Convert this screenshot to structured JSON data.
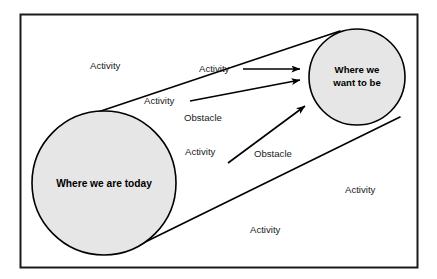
{
  "diagram": {
    "type": "gap-analysis-cone-diagram",
    "frame": {
      "border_color": "#1a1a1a",
      "background": "#ffffff"
    },
    "nodes": [
      {
        "id": "current-state",
        "label_lines": [
          "Where we are today"
        ],
        "cx": 104,
        "cy": 183,
        "r": 72,
        "fill": "#e6e6e6",
        "stroke": "#000000"
      },
      {
        "id": "future-state",
        "label_lines": [
          "Where we",
          "want to be"
        ],
        "cx": 357,
        "cy": 77,
        "r": 48,
        "fill": "#e6e6e6",
        "stroke": "#000000"
      }
    ],
    "arrows": [
      {
        "id": "arrow-1",
        "x1": 243,
        "y1": 69,
        "x2": 300,
        "y2": 69
      },
      {
        "id": "arrow-2",
        "x1": 190,
        "y1": 101,
        "x2": 300,
        "y2": 80
      },
      {
        "id": "arrow-3",
        "x1": 228,
        "y1": 163,
        "x2": 305,
        "y2": 106
      }
    ],
    "tangents": [
      {
        "id": "tangent-top",
        "x1": 68,
        "y1": 122,
        "x2": 340,
        "y2": 31
      },
      {
        "id": "tangent-bottom",
        "x1": 133,
        "y1": 248,
        "x2": 400,
        "y2": 117
      }
    ],
    "labels": [
      {
        "id": "label-activity-1",
        "text": "Activity",
        "x": 90,
        "y": 66,
        "anchor": "start"
      },
      {
        "id": "label-activity-2",
        "text": "Activity",
        "x": 199,
        "y": 69,
        "anchor": "start"
      },
      {
        "id": "label-activity-3",
        "text": "Activity",
        "x": 144,
        "y": 101,
        "anchor": "start"
      },
      {
        "id": "label-obstacle-1",
        "text": "Obstacle",
        "x": 184,
        "y": 118,
        "anchor": "start"
      },
      {
        "id": "label-activity-4",
        "text": "Activity",
        "x": 185,
        "y": 152,
        "anchor": "start"
      },
      {
        "id": "label-obstacle-2",
        "text": "Obstacle",
        "x": 254,
        "y": 154,
        "anchor": "start"
      },
      {
        "id": "label-activity-5",
        "text": "Activity",
        "x": 345,
        "y": 190,
        "anchor": "start"
      },
      {
        "id": "label-activity-6",
        "text": "Activity",
        "x": 250,
        "y": 230,
        "anchor": "start"
      }
    ]
  }
}
